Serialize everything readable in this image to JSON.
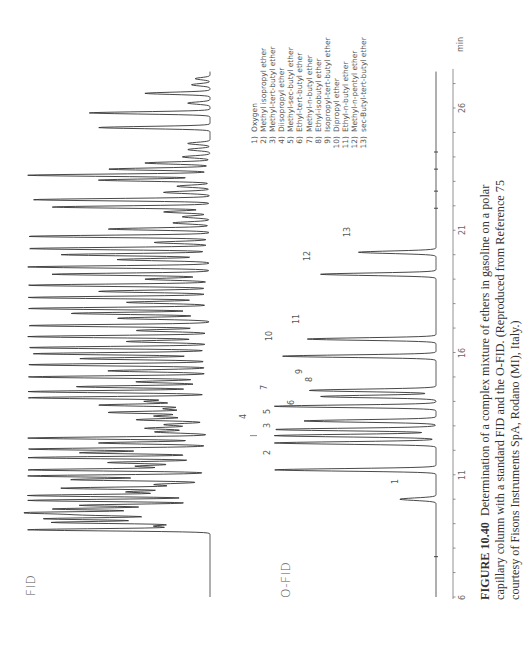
{
  "figure": {
    "trace_labels": {
      "fid": "FID",
      "ofid": "O-FID"
    },
    "axis": {
      "unit": "min",
      "ticks": [
        "6",
        "11",
        "16",
        "21",
        "26"
      ]
    },
    "legend": [
      {
        "num": "1)",
        "name": "Oxygen"
      },
      {
        "num": "2)",
        "name": "Methyl isopropyl ether"
      },
      {
        "num": "3)",
        "name": "Methyl-tert-butyl ether"
      },
      {
        "num": "4)",
        "name": "Diisopropyl ether"
      },
      {
        "num": "5)",
        "name": "Methyl-sec-butyl ether"
      },
      {
        "num": "6)",
        "name": "Ethyl-tert-butyl ether"
      },
      {
        "num": "7)",
        "name": "Methyl-n-butyl ether"
      },
      {
        "num": "8)",
        "name": "Ethyl-isobutyl ether"
      },
      {
        "num": "9)",
        "name": "Isopropyl-tert-butyl ether"
      },
      {
        "num": "10)",
        "name": "Dipropyl ether"
      },
      {
        "num": "11)",
        "name": "Ethyl-n-butyl ether"
      },
      {
        "num": "12)",
        "name": "Methyl-n-pentyl ether"
      },
      {
        "num": "13)",
        "name": "sec-Butyl-tert-butyl ether"
      }
    ],
    "caption": {
      "label": "FIGURE 10.40",
      "text": "Determination of a complex mixture of ethers in gasoline on a polar capillary column with a standard FID and the O-FID. (Reproduced from Reference 75 courtesy of Fisons Instruments SpA, Rodano (MI), Italy.)",
      "line1": "Determination of a complex mixture of ethers in gasoline on a polar",
      "line2": "capillary column with a standard FID and the O-FID. (Reproduced from Reference 75",
      "line3": "courtesy of Fisons Instruments SpA, Rodano (MI), Italy.)"
    }
  },
  "chart_data": [
    {
      "type": "line",
      "title": "FID",
      "xlabel": "min",
      "ylabel": "",
      "xlim": [
        6,
        27.5
      ],
      "x_ticks": [
        6,
        11,
        16,
        21,
        26
      ],
      "orientation": "rotated-90 (time axis runs bottom to top)",
      "description": "Standard FID chromatogram of gasoline: flat baseline from 6 to ~8.7 min, then dense hydrocarbon peaks from ~8.7 to ~27 min",
      "peaks": [
        {
          "t": 8.75,
          "h": 0.98
        },
        {
          "t": 8.9,
          "h": 0.3
        },
        {
          "t": 9.05,
          "h": 0.85
        },
        {
          "t": 9.2,
          "h": 0.9
        },
        {
          "t": 9.35,
          "h": 0.6
        },
        {
          "t": 9.45,
          "h": 0.98
        },
        {
          "t": 9.6,
          "h": 0.85
        },
        {
          "t": 9.75,
          "h": 0.7
        },
        {
          "t": 9.95,
          "h": 0.98
        },
        {
          "t": 10.15,
          "h": 0.98
        },
        {
          "t": 10.3,
          "h": 0.45
        },
        {
          "t": 10.45,
          "h": 0.8
        },
        {
          "t": 10.6,
          "h": 0.3
        },
        {
          "t": 10.8,
          "h": 0.75
        },
        {
          "t": 10.95,
          "h": 0.98
        },
        {
          "t": 11.2,
          "h": 0.98
        },
        {
          "t": 11.35,
          "h": 0.4
        },
        {
          "t": 11.5,
          "h": 0.55
        },
        {
          "t": 11.7,
          "h": 0.98
        },
        {
          "t": 11.9,
          "h": 0.7
        },
        {
          "t": 12.05,
          "h": 0.98
        },
        {
          "t": 12.3,
          "h": 0.6
        },
        {
          "t": 12.5,
          "h": 0.98
        },
        {
          "t": 12.75,
          "h": 0.3
        },
        {
          "t": 12.9,
          "h": 0.35
        },
        {
          "t": 13.05,
          "h": 0.25
        },
        {
          "t": 13.25,
          "h": 0.4
        },
        {
          "t": 13.4,
          "h": 0.3
        },
        {
          "t": 13.55,
          "h": 0.55
        },
        {
          "t": 13.7,
          "h": 0.25
        },
        {
          "t": 13.85,
          "h": 0.6
        },
        {
          "t": 14.0,
          "h": 0.35
        },
        {
          "t": 14.15,
          "h": 0.98
        },
        {
          "t": 14.4,
          "h": 0.98
        },
        {
          "t": 14.6,
          "h": 0.72
        },
        {
          "t": 14.8,
          "h": 0.4
        },
        {
          "t": 15.0,
          "h": 0.98
        },
        {
          "t": 15.25,
          "h": 0.55
        },
        {
          "t": 15.5,
          "h": 0.98
        },
        {
          "t": 15.75,
          "h": 0.7
        },
        {
          "t": 15.95,
          "h": 0.95
        },
        {
          "t": 16.2,
          "h": 0.98
        },
        {
          "t": 16.45,
          "h": 0.45
        },
        {
          "t": 16.65,
          "h": 0.98
        },
        {
          "t": 16.9,
          "h": 0.4
        },
        {
          "t": 17.1,
          "h": 0.98
        },
        {
          "t": 17.4,
          "h": 0.5
        },
        {
          "t": 17.6,
          "h": 0.75
        },
        {
          "t": 17.8,
          "h": 0.98
        },
        {
          "t": 18.05,
          "h": 0.45
        },
        {
          "t": 18.25,
          "h": 0.98
        },
        {
          "t": 18.5,
          "h": 0.6
        },
        {
          "t": 18.75,
          "h": 0.98
        },
        {
          "t": 19.0,
          "h": 0.35
        },
        {
          "t": 19.2,
          "h": 0.85
        },
        {
          "t": 19.5,
          "h": 0.98
        },
        {
          "t": 19.8,
          "h": 0.5
        },
        {
          "t": 20.0,
          "h": 0.8
        },
        {
          "t": 20.25,
          "h": 0.98
        },
        {
          "t": 20.5,
          "h": 0.3
        },
        {
          "t": 20.75,
          "h": 0.98
        },
        {
          "t": 21.05,
          "h": 0.55
        },
        {
          "t": 21.3,
          "h": 0.2
        },
        {
          "t": 21.55,
          "h": 0.15
        },
        {
          "t": 21.75,
          "h": 0.25
        },
        {
          "t": 21.95,
          "h": 0.85
        },
        {
          "t": 22.25,
          "h": 0.95
        },
        {
          "t": 22.55,
          "h": 0.25
        },
        {
          "t": 22.8,
          "h": 0.18
        },
        {
          "t": 23.05,
          "h": 0.6
        },
        {
          "t": 23.25,
          "h": 0.98
        },
        {
          "t": 23.5,
          "h": 0.55
        },
        {
          "t": 23.75,
          "h": 0.35
        },
        {
          "t": 24.0,
          "h": 0.15
        },
        {
          "t": 24.3,
          "h": 0.12
        },
        {
          "t": 24.55,
          "h": 0.12
        },
        {
          "t": 25.2,
          "h": 0.6
        },
        {
          "t": 25.8,
          "h": 0.65
        },
        {
          "t": 26.2,
          "h": 0.12
        },
        {
          "t": 26.6,
          "h": 0.35
        },
        {
          "t": 26.95,
          "h": 0.1
        },
        {
          "t": 27.2,
          "h": 0.08
        }
      ]
    },
    {
      "type": "line",
      "title": "O-FID",
      "xlabel": "min",
      "ylabel": "",
      "xlim": [
        6,
        27.5
      ],
      "x_ticks": [
        6,
        11,
        16,
        21,
        26
      ],
      "orientation": "rotated-90 (time axis runs bottom to top)",
      "description": "Oxygen-selective FID chromatogram showing 13 numbered ether peaks",
      "peaks": [
        {
          "label": "1",
          "compound": "Oxygen",
          "t": 10.0,
          "h": 0.22
        },
        {
          "label": "2",
          "compound": "Methyl isopropyl ether",
          "t": 11.2,
          "h": 0.98
        },
        {
          "label": "3",
          "compound": "Methyl-tert-butyl ether",
          "t": 12.3,
          "h": 0.98
        },
        {
          "label": "4",
          "compound": "Diisopropyl ether",
          "t": 12.6,
          "h": 0.98
        },
        {
          "label": "5",
          "compound": "Methyl-sec-butyl ether",
          "t": 12.85,
          "h": 0.98
        },
        {
          "label": "6",
          "compound": "Ethyl-tert-butyl ether",
          "t": 13.2,
          "h": 0.8
        },
        {
          "label": "7",
          "compound": "Methyl-n-butyl ether",
          "t": 13.8,
          "h": 0.98
        },
        {
          "label": "8",
          "compound": "Ethyl-isobutyl ether",
          "t": 14.2,
          "h": 0.7
        },
        {
          "label": "9",
          "compound": "Isopropyl-tert-butyl ether",
          "t": 14.45,
          "h": 0.77
        },
        {
          "label": "10",
          "compound": "Dipropyl ether",
          "t": 15.85,
          "h": 0.93
        },
        {
          "label": "11",
          "compound": "Ethyl-n-butyl ether",
          "t": 16.55,
          "h": 0.78
        },
        {
          "label": "12",
          "compound": "Methyl-n-pentyl ether",
          "t": 19.2,
          "h": 0.7
        },
        {
          "label": "13",
          "compound": "sec-Butyl-tert-butyl ether",
          "t": 20.1,
          "h": 0.47
        }
      ]
    }
  ]
}
